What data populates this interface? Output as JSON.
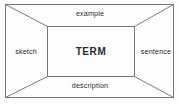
{
  "diagram": {
    "type": "perspective-box-vocabulary-map",
    "title": "",
    "center": {
      "label": "TERM"
    },
    "walls": [
      {
        "id": "top",
        "label": "example"
      },
      {
        "id": "left",
        "label": "sketch"
      },
      {
        "id": "right",
        "label": "sentence"
      },
      {
        "id": "bottom",
        "label": "description"
      }
    ],
    "geometry": {
      "outer": {
        "x1": 5,
        "y1": 4,
        "x2": 174,
        "y2": 98
      },
      "inner": {
        "x1": 47,
        "y1": 26,
        "x2": 135,
        "y2": 77
      }
    },
    "style": {
      "line_color": "#6b6b6b",
      "line_width": 0.9,
      "text_color": "#2b2b2b",
      "background": "#fdfdfd"
    }
  }
}
